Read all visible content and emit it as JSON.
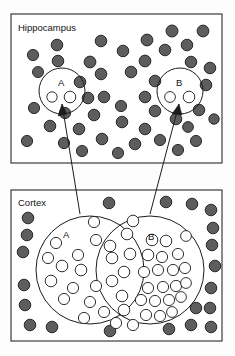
{
  "figure": {
    "type": "diagram",
    "title_visible": false,
    "background_color": "#fdfdfd",
    "width": 235,
    "height": 356,
    "colors": {
      "filled_neuron": "#5d5d5d",
      "open_neuron": "#ffffff",
      "stroke": "#1c1c1c",
      "panel_stroke": "#2b2b2b",
      "panel_fill": "#ffffff"
    }
  },
  "panels": [
    {
      "id": "hippocampus",
      "label": "Hippocampus",
      "label_x": 18,
      "label_y": 31,
      "rect": {
        "x": 11,
        "y": 14,
        "w": 211,
        "h": 149
      },
      "ensembles": [
        {
          "id": "hippocampus-ensemble-a",
          "label": "A",
          "cx": 62,
          "cy": 91,
          "r": 23,
          "label_x": 58,
          "label_y": 86
        },
        {
          "id": "hippocampus-ensemble-b",
          "label": "B",
          "cx": 180,
          "cy": 91,
          "r": 23,
          "label_x": 176,
          "label_y": 86
        }
      ],
      "open_neurons": [
        {
          "cx": 52,
          "cy": 97,
          "r": 5.2
        },
        {
          "cx": 70,
          "cy": 97,
          "r": 5.8
        },
        {
          "cx": 170,
          "cy": 97,
          "r": 5.4
        },
        {
          "cx": 189,
          "cy": 97,
          "r": 5.8
        }
      ],
      "filled_neurons": [
        {
          "cx": 33,
          "cy": 55,
          "r": 5.6
        },
        {
          "cx": 57,
          "cy": 45,
          "r": 5.8
        },
        {
          "cx": 58,
          "cy": 61,
          "r": 5.8
        },
        {
          "cx": 101,
          "cy": 41,
          "r": 5.8
        },
        {
          "cx": 147,
          "cy": 40,
          "r": 5.9
        },
        {
          "cx": 172,
          "cy": 31,
          "r": 6.0
        },
        {
          "cx": 203,
          "cy": 31,
          "r": 5.9
        },
        {
          "cx": 123,
          "cy": 51,
          "r": 5.8
        },
        {
          "cx": 165,
          "cy": 50,
          "r": 5.8
        },
        {
          "cx": 187,
          "cy": 45,
          "r": 5.8
        },
        {
          "cx": 90,
          "cy": 62,
          "r": 5.9
        },
        {
          "cx": 145,
          "cy": 61,
          "r": 5.9
        },
        {
          "cx": 191,
          "cy": 62,
          "r": 5.8
        },
        {
          "cx": 210,
          "cy": 68,
          "r": 5.8
        },
        {
          "cx": 38,
          "cy": 72,
          "r": 5.5
        },
        {
          "cx": 101,
          "cy": 74,
          "r": 5.8
        },
        {
          "cx": 131,
          "cy": 72,
          "r": 5.8
        },
        {
          "cx": 155,
          "cy": 81,
          "r": 5.8
        },
        {
          "cx": 80,
          "cy": 82,
          "r": 5.8
        },
        {
          "cx": 206,
          "cy": 85,
          "r": 5.8
        },
        {
          "cx": 88,
          "cy": 98,
          "r": 5.8
        },
        {
          "cx": 104,
          "cy": 97,
          "r": 5.8
        },
        {
          "cx": 145,
          "cy": 97,
          "r": 5.8
        },
        {
          "cx": 34,
          "cy": 108,
          "r": 5.6
        },
        {
          "cx": 65,
          "cy": 113,
          "r": 5.6
        },
        {
          "cx": 121,
          "cy": 106,
          "r": 5.6
        },
        {
          "cx": 155,
          "cy": 111,
          "r": 5.8
        },
        {
          "cx": 199,
          "cy": 110,
          "r": 5.8
        },
        {
          "cx": 94,
          "cy": 115,
          "r": 5.8
        },
        {
          "cx": 214,
          "cy": 119,
          "r": 5.2
        },
        {
          "cx": 122,
          "cy": 122,
          "r": 5.8
        },
        {
          "cx": 176,
          "cy": 119,
          "r": 5.8
        },
        {
          "cx": 50,
          "cy": 126,
          "r": 5.8
        },
        {
          "cx": 79,
          "cy": 129,
          "r": 5.8
        },
        {
          "cx": 145,
          "cy": 129,
          "r": 5.8
        },
        {
          "cx": 188,
          "cy": 127,
          "r": 5.4
        },
        {
          "cx": 27,
          "cy": 141,
          "r": 5.6
        },
        {
          "cx": 64,
          "cy": 143,
          "r": 5.6
        },
        {
          "cx": 102,
          "cy": 139,
          "r": 5.8
        },
        {
          "cx": 135,
          "cy": 144,
          "r": 5.8
        },
        {
          "cx": 160,
          "cy": 140,
          "r": 5.6
        },
        {
          "cx": 196,
          "cy": 141,
          "r": 5.6
        },
        {
          "cx": 82,
          "cy": 151,
          "r": 5.6
        },
        {
          "cx": 118,
          "cy": 153,
          "r": 5.6
        },
        {
          "cx": 178,
          "cy": 150,
          "r": 5.6
        }
      ]
    },
    {
      "id": "cortex",
      "label": "Cortex",
      "label_x": 18,
      "label_y": 206,
      "rect": {
        "x": 11,
        "y": 190,
        "w": 211,
        "h": 151
      },
      "ensembles": [
        {
          "id": "cortex-ensemble-a",
          "label": "A",
          "cx": 90,
          "cy": 270,
          "r": 54,
          "label_x": 63,
          "label_y": 238
        },
        {
          "id": "cortex-ensemble-b",
          "label": "B",
          "cx": 150,
          "cy": 270,
          "r": 54,
          "label_x": 148,
          "label_y": 240
        }
      ],
      "open_neurons": [
        {
          "cx": 94,
          "cy": 222,
          "r": 5.6
        },
        {
          "cx": 96,
          "cy": 240,
          "r": 5.6
        },
        {
          "cx": 56,
          "cy": 243,
          "r": 5.6
        },
        {
          "cx": 127,
          "cy": 234,
          "r": 5.8
        },
        {
          "cx": 133,
          "cy": 221,
          "r": 5.8
        },
        {
          "cx": 78,
          "cy": 255,
          "r": 5.6
        },
        {
          "cx": 48,
          "cy": 258,
          "r": 5.6
        },
        {
          "cx": 62,
          "cy": 266,
          "r": 5.8
        },
        {
          "cx": 81,
          "cy": 270,
          "r": 5.8
        },
        {
          "cx": 51,
          "cy": 281,
          "r": 5.8
        },
        {
          "cx": 73,
          "cy": 288,
          "r": 5.6
        },
        {
          "cx": 64,
          "cy": 299,
          "r": 5.6
        },
        {
          "cx": 90,
          "cy": 302,
          "r": 5.6
        },
        {
          "cx": 96,
          "cy": 286,
          "r": 5.6
        },
        {
          "cx": 104,
          "cy": 312,
          "r": 5.6
        },
        {
          "cx": 84,
          "cy": 318,
          "r": 5.6
        },
        {
          "cx": 112,
          "cy": 258,
          "r": 5.8
        },
        {
          "cx": 112,
          "cy": 281,
          "r": 5.8
        },
        {
          "cx": 110,
          "cy": 246,
          "r": 5.8
        },
        {
          "cx": 124,
          "cy": 272,
          "r": 5.8
        },
        {
          "cx": 122,
          "cy": 296,
          "r": 5.8
        },
        {
          "cx": 124,
          "cy": 310,
          "r": 5.8
        },
        {
          "cx": 130,
          "cy": 254,
          "r": 5.8
        },
        {
          "cx": 116,
          "cy": 323,
          "r": 5.6
        },
        {
          "cx": 148,
          "cy": 255,
          "r": 5.8
        },
        {
          "cx": 152,
          "cy": 240,
          "r": 5.8
        },
        {
          "cx": 166,
          "cy": 241,
          "r": 5.8
        },
        {
          "cx": 162,
          "cy": 257,
          "r": 5.6
        },
        {
          "cx": 178,
          "cy": 254,
          "r": 5.6
        },
        {
          "cx": 144,
          "cy": 272,
          "r": 5.6
        },
        {
          "cx": 158,
          "cy": 270,
          "r": 5.6
        },
        {
          "cx": 173,
          "cy": 270,
          "r": 5.6
        },
        {
          "cx": 185,
          "cy": 268,
          "r": 5.6
        },
        {
          "cx": 148,
          "cy": 288,
          "r": 5.6
        },
        {
          "cx": 163,
          "cy": 287,
          "r": 5.6
        },
        {
          "cx": 176,
          "cy": 286,
          "r": 5.6
        },
        {
          "cx": 186,
          "cy": 283,
          "r": 5.4
        },
        {
          "cx": 141,
          "cy": 300,
          "r": 5.6
        },
        {
          "cx": 155,
          "cy": 301,
          "r": 5.6
        },
        {
          "cx": 169,
          "cy": 300,
          "r": 5.6
        },
        {
          "cx": 181,
          "cy": 297,
          "r": 5.4
        },
        {
          "cx": 146,
          "cy": 315,
          "r": 5.6
        },
        {
          "cx": 160,
          "cy": 316,
          "r": 5.6
        },
        {
          "cx": 172,
          "cy": 312,
          "r": 5.4
        },
        {
          "cx": 133,
          "cy": 325,
          "r": 5.6
        },
        {
          "cx": 186,
          "cy": 236,
          "r": 5.4
        }
      ],
      "filled_neurons": [
        {
          "cx": 109,
          "cy": 203,
          "r": 5.8
        },
        {
          "cx": 166,
          "cy": 202,
          "r": 5.8
        },
        {
          "cx": 192,
          "cy": 204,
          "r": 5.8
        },
        {
          "cx": 211,
          "cy": 210,
          "r": 5.8
        },
        {
          "cx": 28,
          "cy": 218,
          "r": 5.8
        },
        {
          "cx": 213,
          "cy": 228,
          "r": 5.8
        },
        {
          "cx": 27,
          "cy": 235,
          "r": 5.8
        },
        {
          "cx": 212,
          "cy": 245,
          "r": 5.8
        },
        {
          "cx": 23,
          "cy": 252,
          "r": 5.8
        },
        {
          "cx": 215,
          "cy": 266,
          "r": 5.8
        },
        {
          "cx": 24,
          "cy": 285,
          "r": 5.8
        },
        {
          "cx": 211,
          "cy": 288,
          "r": 5.8
        },
        {
          "cx": 25,
          "cy": 305,
          "r": 5.8
        },
        {
          "cx": 210,
          "cy": 308,
          "r": 5.8
        },
        {
          "cx": 30,
          "cy": 325,
          "r": 5.8
        },
        {
          "cx": 52,
          "cy": 327,
          "r": 5.8
        },
        {
          "cx": 110,
          "cy": 331,
          "r": 5.8
        },
        {
          "cx": 169,
          "cy": 329,
          "r": 5.8
        },
        {
          "cx": 191,
          "cy": 325,
          "r": 5.8
        },
        {
          "cx": 196,
          "cy": 308,
          "r": 5.8
        },
        {
          "cx": 211,
          "cy": 327,
          "r": 5.8
        }
      ]
    }
  ],
  "projections": [
    {
      "id": "projection-a",
      "from_panel": "cortex",
      "from_ensemble": "A",
      "to_panel": "hippocampus",
      "to_ensemble": "A",
      "path": "M 80 214 L 62 104",
      "arrow": "M 62 104 L 58 116 L 67 114 Z"
    },
    {
      "id": "projection-b",
      "from_panel": "cortex",
      "from_ensemble": "B",
      "to_panel": "hippocampus",
      "to_ensemble": "B",
      "path": "M 150 214 L 179 104",
      "arrow": "M 179 104 L 172 114 L 182 115 Z"
    }
  ]
}
